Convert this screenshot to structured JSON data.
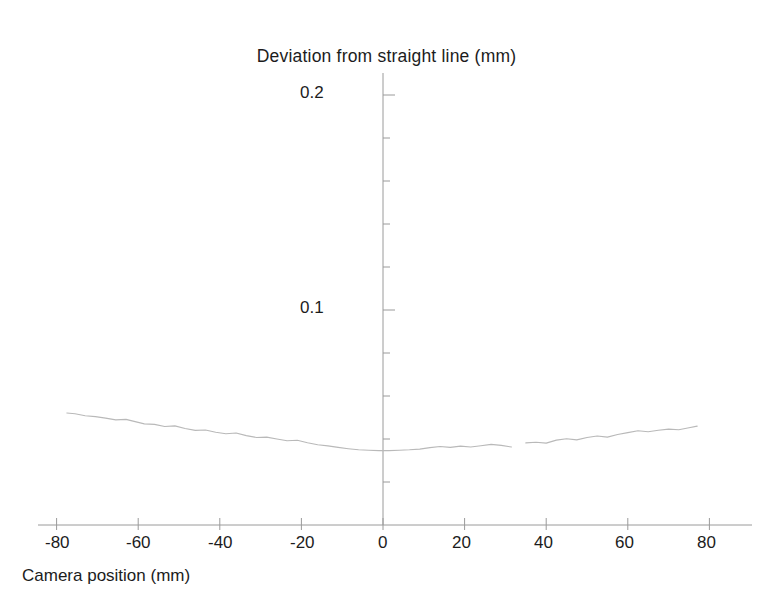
{
  "chart_data": {
    "type": "line",
    "title": "Deviation from straight line (mm)",
    "xlabel": "Camera position (mm)",
    "ylabel": "Deviation from straight line (mm)",
    "xlim": [
      -88,
      88
    ],
    "ylim": [
      0,
      0.215
    ],
    "grid": false,
    "legend": null,
    "x_ticks": [
      -80,
      -60,
      -40,
      -20,
      0,
      20,
      40,
      60,
      80
    ],
    "x_tick_labels": [
      "-80",
      "-60",
      "-40",
      "-20",
      "0",
      "20",
      "40",
      "60",
      "80"
    ],
    "y_ticks": [
      0.1,
      0.2
    ],
    "y_tick_labels": [
      "0.1",
      "0.2"
    ],
    "y_minor_tick_interval": 0.02,
    "line_color": "#b9b9b9",
    "axis_color": "#8f8f8f",
    "series": [
      {
        "name": "Deviation",
        "x": [
          -77.5,
          -75.5,
          -73.0,
          -70.5,
          -68.0,
          -65.5,
          -63.0,
          -61.0,
          -58.5,
          -56.0,
          -53.5,
          -51.0,
          -48.5,
          -46.0,
          -43.5,
          -41.0,
          -38.5,
          -36.0,
          -33.5,
          -31.0,
          -28.5,
          -26.0,
          -23.5,
          -21.0,
          -18.5,
          -16.0,
          -13.5,
          -11.0,
          -8.5,
          -6.0,
          -3.5,
          -1.0,
          1.5,
          4.0,
          6.5,
          9.0,
          11.5,
          14.0,
          16.5,
          19.0,
          21.5,
          24.0,
          26.5,
          29.0,
          31.5,
          35.0,
          37.5,
          40.0,
          42.5,
          45.0,
          47.5,
          50.0,
          52.5,
          55.0,
          57.5,
          60.0,
          62.5,
          65.0,
          67.5,
          70.0,
          72.5,
          75.0,
          77.0
        ],
        "y": [
          0.0521,
          0.0517,
          0.0508,
          0.0504,
          0.0497,
          0.0489,
          0.0491,
          0.0482,
          0.047,
          0.0468,
          0.0458,
          0.0461,
          0.0449,
          0.044,
          0.0442,
          0.0431,
          0.0424,
          0.0428,
          0.0416,
          0.0407,
          0.0409,
          0.04,
          0.0392,
          0.0394,
          0.0383,
          0.0373,
          0.0368,
          0.0361,
          0.0355,
          0.035,
          0.0348,
          0.0346,
          0.0346,
          0.0348,
          0.035,
          0.0353,
          0.036,
          0.0365,
          0.0361,
          0.0367,
          0.0363,
          0.0369,
          0.0375,
          0.037,
          0.0363,
          0.0382,
          0.0385,
          0.0381,
          0.0395,
          0.0401,
          0.0396,
          0.0407,
          0.0414,
          0.0409,
          0.0421,
          0.043,
          0.0438,
          0.0434,
          0.0441,
          0.0446,
          0.0443,
          0.0452,
          0.046
        ],
        "gap_after_x": 31.5
      }
    ]
  },
  "axes": {
    "title": "Deviation from straight line (mm)",
    "x_title": "Camera position (mm)",
    "y_labels": [
      {
        "value": "0.2"
      },
      {
        "value": "0.1"
      }
    ],
    "x_labels": [
      {
        "value": "-80"
      },
      {
        "value": "-60"
      },
      {
        "value": "-40"
      },
      {
        "value": "-20"
      },
      {
        "value": "0"
      },
      {
        "value": "20"
      },
      {
        "value": "40"
      },
      {
        "value": "60"
      },
      {
        "value": "80"
      }
    ]
  }
}
